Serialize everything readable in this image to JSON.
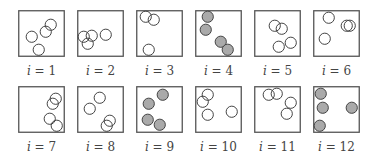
{
  "style": {
    "box_stroke": "#555555",
    "circle_stroke": "#444444",
    "filled_color": "#aaaaaa",
    "empty_color": "#ffffff"
  },
  "panels": [
    {
      "label_var": "i",
      "label_eq": " = 1",
      "filled": false,
      "circles": [
        [
          32,
          14
        ],
        [
          27,
          21
        ],
        [
          13,
          26
        ],
        [
          20,
          39
        ]
      ]
    },
    {
      "label_var": "i",
      "label_eq": " = 2",
      "filled": false,
      "circles": [
        [
          6,
          26
        ],
        [
          14,
          25
        ],
        [
          10,
          33
        ],
        [
          28,
          24
        ]
      ]
    },
    {
      "label_var": "i",
      "label_eq": " = 3",
      "filled": false,
      "circles": [
        [
          9,
          6
        ],
        [
          17,
          9
        ],
        [
          12,
          39
        ]
      ]
    },
    {
      "label_var": "i",
      "label_eq": " = 4",
      "filled": true,
      "circles": [
        [
          12,
          6
        ],
        [
          10,
          19
        ],
        [
          25,
          31
        ],
        [
          32,
          39
        ]
      ]
    },
    {
      "label_var": "i",
      "label_eq": " = 5",
      "filled": false,
      "circles": [
        [
          20,
          15
        ],
        [
          27,
          18
        ],
        [
          24,
          36
        ],
        [
          36,
          32
        ]
      ]
    },
    {
      "label_var": "i",
      "label_eq": " = 6",
      "filled": false,
      "circles": [
        [
          15,
          7
        ],
        [
          33,
          15
        ],
        [
          36,
          15
        ],
        [
          11,
          28
        ]
      ]
    },
    {
      "label_var": "i",
      "label_eq": " = 7",
      "filled": false,
      "circles": [
        [
          37,
          12
        ],
        [
          34,
          17
        ],
        [
          31,
          32
        ],
        [
          38,
          39
        ]
      ]
    },
    {
      "label_var": "i",
      "label_eq": " = 8",
      "filled": false,
      "circles": [
        [
          22,
          11
        ],
        [
          12,
          22
        ],
        [
          32,
          34
        ],
        [
          29,
          39
        ]
      ]
    },
    {
      "label_var": "i",
      "label_eq": " = 9",
      "filled": true,
      "circles": [
        [
          26,
          8
        ],
        [
          12,
          17
        ],
        [
          11,
          33
        ],
        [
          23,
          38
        ]
      ]
    },
    {
      "label_var": "i",
      "label_eq": " = 10",
      "filled": false,
      "circles": [
        [
          12,
          8
        ],
        [
          7,
          15
        ],
        [
          12,
          28
        ],
        [
          36,
          25
        ]
      ]
    },
    {
      "label_var": "i",
      "label_eq": " = 11",
      "filled": false,
      "circles": [
        [
          14,
          8
        ],
        [
          22,
          7
        ],
        [
          36,
          16
        ],
        [
          32,
          27
        ]
      ]
    },
    {
      "label_var": "i",
      "label_eq": " = 12",
      "filled": true,
      "circles": [
        [
          7,
          7
        ],
        [
          9,
          21
        ],
        [
          38,
          21
        ],
        [
          6,
          39
        ]
      ]
    }
  ]
}
